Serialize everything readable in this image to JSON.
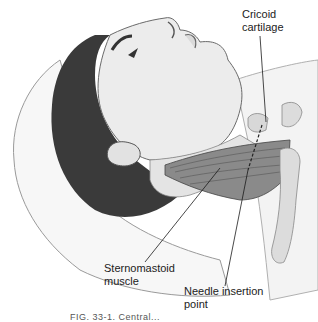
{
  "figure": {
    "type": "anatomical-illustration",
    "labels": [
      {
        "id": "cricoid",
        "text": "Cricoid\ncartilage"
      },
      {
        "id": "sternomastoid",
        "text": "Sternomastoid\nmuscle"
      },
      {
        "id": "needle",
        "text": "Needle insertion\npoint"
      }
    ],
    "caption_partial": "FIG. 33-1. Central..."
  },
  "colors": {
    "background": "#ffffff",
    "skin": "#ececec",
    "skin_shadow": "#d6d6d6",
    "hair": "#3a3a3a",
    "muscle": "#8a8a8a",
    "bone": "#dcdcdc",
    "outline": "#555555",
    "leader": "#1a1a1a"
  }
}
